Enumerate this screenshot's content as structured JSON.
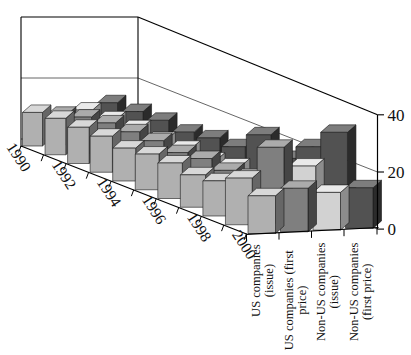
{
  "chart_data": {
    "type": "bar",
    "projection": "3d-perspective",
    "title": "",
    "x_years": [
      "1990",
      "1991",
      "1992",
      "1993",
      "1994",
      "1995",
      "1996",
      "1997",
      "1998",
      "1999",
      "2000"
    ],
    "year_axis_labeled": [
      "1990",
      "1992",
      "1994",
      "1996",
      "1998",
      "2000"
    ],
    "series": [
      {
        "name": "US companies (issue)",
        "label_lines": [
          "US companies",
          "(issue)"
        ],
        "values": [
          11,
          12,
          12,
          12,
          11,
          12,
          12,
          11,
          12,
          16,
          13
        ],
        "color_front": "#b0b0b0",
        "color_top": "#d8d8d8",
        "color_side": "#666666"
      },
      {
        "name": "US companies (first price)",
        "label_lines": [
          "US companies (first",
          "price)"
        ],
        "values": [
          10,
          12,
          13,
          13,
          13,
          12,
          13,
          12,
          13,
          26,
          15
        ],
        "color_front": "#7f7f7f",
        "color_top": "#ababab",
        "color_side": "#454545"
      },
      {
        "name": "Non-US companies (issue)",
        "label_lines": [
          "Non-US companies",
          "(issue)"
        ],
        "values": [
          11,
          11,
          11,
          10,
          10,
          9,
          10,
          9,
          11,
          19,
          13
        ],
        "color_front": "#d2d2d2",
        "color_top": "#eaeaea",
        "color_side": "#8c8c8c"
      },
      {
        "name": "Non-US companies (first price)",
        "label_lines": [
          "Non-US companies",
          "(first price)"
        ],
        "values": [
          13,
          13,
          13,
          12,
          13,
          13,
          20,
          15,
          22,
          30,
          14
        ],
        "color_front": "#525252",
        "color_top": "#7d7d7d",
        "color_side": "#2b2b2b"
      }
    ],
    "value_axis": {
      "ticks": [
        "0",
        "20",
        "40"
      ],
      "min": 0,
      "max": 40
    },
    "legend": "none",
    "grid": "back-walls",
    "outline_color": "#1a1a1a",
    "axis_color": "#000000",
    "gridline_color": "#555555",
    "background": "#ffffff"
  }
}
